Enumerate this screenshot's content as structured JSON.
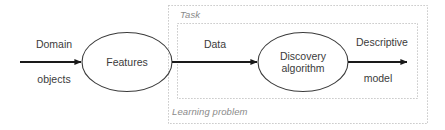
{
  "diagram": {
    "type": "flowchart",
    "groups": [
      {
        "id": "learning-problem",
        "label": "Learning problem",
        "style": "dotted-box",
        "color": "#b0b0b0"
      },
      {
        "id": "task",
        "label": "Task",
        "style": "dotted-box",
        "color": "#b0b0b0"
      }
    ],
    "nodes": [
      {
        "id": "features",
        "label_line1": "Features",
        "label_line2": "",
        "shape": "ellipse",
        "stroke": "#3b3b3b"
      },
      {
        "id": "discovery-algorithm",
        "label_line1": "Discovery",
        "label_line2": "algorithm",
        "shape": "ellipse",
        "stroke": "#3b3b3b"
      }
    ],
    "edges": [
      {
        "id": "domain-objects-edge",
        "label_above": "Domain",
        "label_below": "objects",
        "from": "",
        "to": "features",
        "stroke": "#1a1a1a"
      },
      {
        "id": "data-edge",
        "label_above": "Data",
        "label_below": "",
        "from": "features",
        "to": "discovery-algorithm",
        "stroke": "#1a1a1a"
      },
      {
        "id": "descriptive-model-edge",
        "label_above": "Descriptive",
        "label_below": "model",
        "from": "discovery-algorithm",
        "to": "",
        "stroke": "#1a1a1a"
      }
    ],
    "colors": {
      "background": "#ffffff",
      "arrow": "#1a1a1a",
      "node_stroke": "#3b3b3b",
      "node_text": "#3b3b3b",
      "group_border": "#b0b0b0",
      "group_text": "#8a8a8a"
    }
  }
}
